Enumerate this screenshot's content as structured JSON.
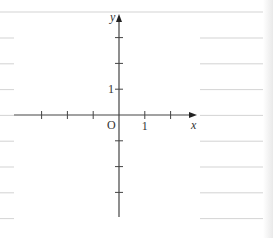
{
  "figure": {
    "type": "coordinate-plane-worksheet",
    "axes": {
      "x_label": "x",
      "y_label": "y",
      "origin_label": "O",
      "x_tick_label": "1",
      "y_tick_label": "1",
      "x_ticks": [
        -3,
        -2,
        -1,
        1,
        2
      ],
      "y_ticks": [
        -3,
        -2,
        -1,
        1,
        2,
        3
      ],
      "x_range": [
        -4,
        3
      ],
      "y_range": [
        -4,
        4
      ]
    },
    "ruled_lines": {
      "count_left": 8,
      "count_right": 9
    },
    "colors": {
      "axis": "#444444",
      "ruled_line": "#c8c8c8",
      "text": "#333333"
    }
  }
}
